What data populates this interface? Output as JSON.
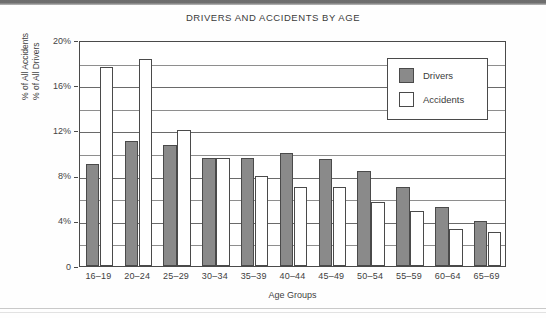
{
  "chart_data": {
    "type": "bar",
    "title": "DRIVERS AND ACCIDENTS BY AGE",
    "xlabel": "Age Groups",
    "ylabel_lines": [
      "% of All Accidents",
      "% of All Drivers"
    ],
    "categories": [
      "16–19",
      "20–24",
      "25–29",
      "30–34",
      "35–39",
      "40–44",
      "45–49",
      "50–54",
      "55–59",
      "60–64",
      "65–69"
    ],
    "series": [
      {
        "name": "Drivers",
        "color": "#8a8a8a",
        "values": [
          9.0,
          11.1,
          10.7,
          9.6,
          9.6,
          10.0,
          9.5,
          8.4,
          7.0,
          5.2,
          4.0
        ]
      },
      {
        "name": "Accidents",
        "color": "#ffffff",
        "values": [
          17.6,
          18.3,
          12.0,
          9.6,
          8.0,
          7.0,
          7.0,
          5.7,
          4.9,
          3.3,
          3.0
        ]
      }
    ],
    "ylim": [
      0,
      20
    ],
    "ytick_labels": [
      "20%",
      "16%",
      "12%",
      "8%",
      "4%",
      "0"
    ],
    "ytick_values": [
      20,
      16,
      12,
      8,
      4,
      0
    ],
    "minor_gridline_values": [
      18,
      14,
      10,
      6,
      2
    ],
    "grid": true,
    "legend_position": "top-right",
    "legend_entries": [
      "Drivers",
      "Accidents"
    ]
  }
}
